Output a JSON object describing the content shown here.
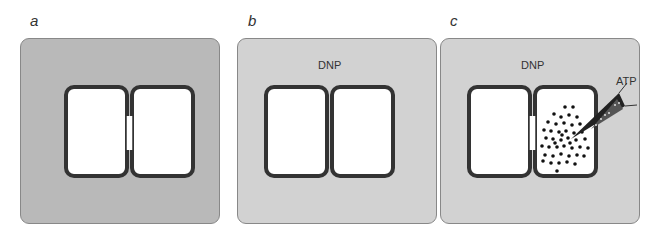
{
  "panels": [
    {
      "label": "a",
      "bath": "",
      "background": "#b9b9b9",
      "junction_open": true,
      "atp_injected": false
    },
    {
      "label": "b",
      "bath": "DNP",
      "background": "#d2d2d2",
      "junction_open": false,
      "atp_injected": false
    },
    {
      "label": "c",
      "bath": "DNP",
      "background": "#d2d2d2",
      "junction_open": true,
      "atp_injected": true,
      "injection_label": "ATP"
    }
  ],
  "colors": {
    "membrane": "#333333",
    "cell_interior": "#ffffff",
    "atp_dots": "#111111"
  }
}
